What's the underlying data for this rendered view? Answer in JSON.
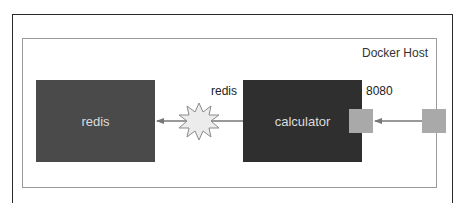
{
  "diagram": {
    "host": {
      "label": "Docker Host"
    },
    "containers": [
      {
        "id": "redis",
        "label": "redis",
        "color": "#4a4a4a"
      },
      {
        "id": "calculator",
        "label": "calculator",
        "color": "#2f2f2f"
      }
    ],
    "link": {
      "label": "redis",
      "from": "calculator",
      "to": "redis",
      "marker": "starburst"
    },
    "port": {
      "label": "8080",
      "color": "#a9a9a9"
    },
    "colors": {
      "outer_frame": "#2a2a2a",
      "host_frame": "#9a9a9a",
      "arrow": "#777777",
      "starburst_fill": "#ececec",
      "starburst_stroke": "#8a8a8a"
    }
  }
}
